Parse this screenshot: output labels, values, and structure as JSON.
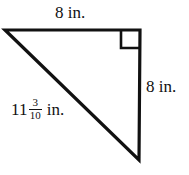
{
  "figure": {
    "shape": "right triangle",
    "stroke_color": "#111111",
    "fill_color": "#ffffff",
    "background_color": "#ffffff",
    "labels": {
      "top_leg": "8 in.",
      "right_leg": "8 in.",
      "hypotenuse": {
        "whole": "11",
        "numerator": "3",
        "denominator": "10",
        "unit": "in."
      }
    },
    "right_angle_marker": {
      "present": "true",
      "location": "top-right vertex"
    },
    "geometry": {
      "vertices": {
        "left": "5,30",
        "top_right": "140,30",
        "bottom_right": "139,160"
      }
    }
  }
}
